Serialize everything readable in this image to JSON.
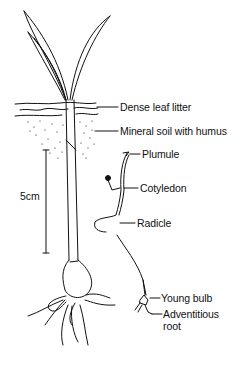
{
  "diagram": {
    "labels": {
      "leaf_litter": "Dense leaf litter",
      "mineral_soil": "Mineral soil with humus",
      "plumule": "Plumule",
      "cotyledon": "Cotyledon",
      "radicle": "Radicle",
      "young_bulb": "Young bulb",
      "adventitious_root_line1": "Adventitious",
      "adventitious_root_line2": "root"
    },
    "scale_bar": {
      "label": "5cm"
    },
    "colors": {
      "ink": "#111111",
      "background": "#ffffff"
    }
  }
}
